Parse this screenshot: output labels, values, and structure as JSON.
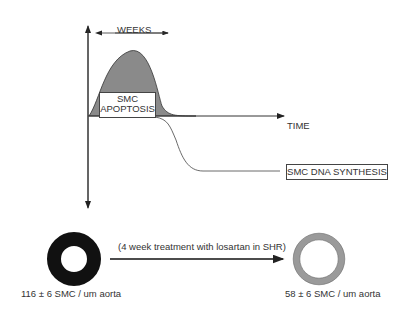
{
  "diagram": {
    "y_axis_label": "CHANGE VERSUS CONTROL",
    "x_axis_label": "TIME",
    "weeks_label": "WEEKS",
    "apoptosis_label_line1": "SMC",
    "apoptosis_label_line2": "APOPTOSIS",
    "dna_synthesis_label": "SMC DNA SYNTHESIS",
    "treatment_label": "(4 week treatment with losartan in SHR)",
    "before": {
      "label": "116 ± 6 SMC / um aorta",
      "value": "116",
      "error": "6",
      "ring_color": "#111111"
    },
    "after": {
      "label": "58 ± 6 SMC / um aorta",
      "value": "58",
      "error": "6",
      "ring_color": "#9a9a9a"
    },
    "colors": {
      "apoptosis_fill": "#8a8a8a",
      "lines": "#333333"
    }
  }
}
